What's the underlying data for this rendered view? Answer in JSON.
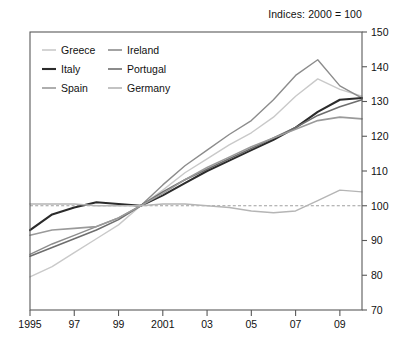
{
  "chart_data": {
    "type": "line",
    "title": "Indices: 2000 = 100",
    "xlabel": "",
    "ylabel": "",
    "xlim": [
      1995,
      2010
    ],
    "ylim": [
      70,
      150
    ],
    "yticks": [
      70,
      80,
      90,
      100,
      110,
      120,
      130,
      140,
      150
    ],
    "ytick_labels": [
      "70",
      "80",
      "90",
      "100",
      "110",
      "120",
      "130",
      "140",
      "150"
    ],
    "y_axis_position": "right",
    "xticks": [
      1995,
      1997,
      1999,
      2001,
      2003,
      2005,
      2007,
      2009
    ],
    "xtick_labels": [
      "1995",
      "97",
      "99",
      "2001",
      "03",
      "05",
      "07",
      "09"
    ],
    "grid": false,
    "reference_line": 100,
    "legend_position": "top-left-inside",
    "legend_columns": 2,
    "x": [
      1995,
      1996,
      1997,
      1998,
      1999,
      2000,
      2001,
      2002,
      2003,
      2004,
      2005,
      2006,
      2007,
      2008,
      2009,
      2010
    ],
    "series": [
      {
        "name": "Greece",
        "color": "#c9c9c9",
        "width": 1.4,
        "values": [
          79.5,
          82.5,
          86.5,
          90.5,
          94.5,
          100.0,
          104.5,
          109.5,
          113.5,
          117.5,
          121.0,
          125.5,
          131.5,
          136.5,
          133.5,
          131.5
        ]
      },
      {
        "name": "Ireland",
        "color": "#8c8c8c",
        "width": 1.4,
        "values": [
          86.0,
          89.0,
          91.5,
          94.0,
          96.5,
          100.0,
          106.0,
          111.5,
          116.0,
          120.5,
          124.5,
          130.5,
          137.5,
          142.0,
          134.5,
          131.0
        ]
      },
      {
        "name": "Italy",
        "color": "#2b2b2b",
        "width": 2.1,
        "values": [
          93.0,
          97.5,
          99.5,
          101.0,
          100.5,
          100.0,
          103.0,
          106.5,
          110.0,
          113.0,
          116.0,
          119.0,
          122.5,
          127.0,
          130.5,
          131.0
        ]
      },
      {
        "name": "Portugal",
        "color": "#6e6e6e",
        "width": 1.6,
        "values": [
          85.5,
          88.0,
          90.5,
          93.0,
          96.0,
          100.0,
          104.0,
          107.5,
          110.5,
          113.5,
          116.5,
          119.5,
          122.5,
          126.0,
          128.5,
          130.5
        ]
      },
      {
        "name": "Spain",
        "color": "#9a9a9a",
        "width": 1.6,
        "values": [
          91.5,
          93.0,
          93.5,
          94.0,
          96.5,
          100.0,
          103.5,
          107.5,
          111.0,
          114.0,
          117.0,
          119.5,
          122.0,
          124.5,
          125.5,
          125.0
        ]
      },
      {
        "name": "Germany",
        "color": "#b5b5b5",
        "width": 1.4,
        "values": [
          100.5,
          100.5,
          100.5,
          100.0,
          100.0,
          100.0,
          100.5,
          100.5,
          100.0,
          99.5,
          98.5,
          98.0,
          98.5,
          101.5,
          104.5,
          104.0
        ]
      }
    ]
  }
}
